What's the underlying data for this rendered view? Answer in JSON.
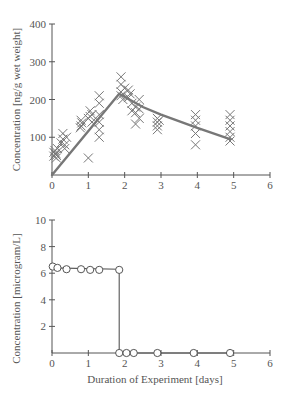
{
  "chart_data": [
    {
      "type": "scatter",
      "title": "",
      "xlabel": "",
      "ylabel": "Concentration [ng/g wet weight]",
      "xlim": [
        0,
        6
      ],
      "ylim": [
        0,
        400
      ],
      "xticks": [
        "0",
        "1",
        "2",
        "3",
        "4",
        "5",
        "6"
      ],
      "yticks": [
        "100",
        "200",
        "300",
        "400"
      ],
      "grid": false,
      "legend": null,
      "series": [
        {
          "name": "Observed tissue concentration",
          "marker": "x",
          "points": [
            [
              0.05,
              60
            ],
            [
              0.05,
              50
            ],
            [
              0.08,
              65
            ],
            [
              0.1,
              55
            ],
            [
              0.12,
              45
            ],
            [
              0.15,
              70
            ],
            [
              0.1,
              58
            ],
            [
              0.12,
              52
            ],
            [
              0.3,
              110
            ],
            [
              0.3,
              95
            ],
            [
              0.35,
              80
            ],
            [
              0.35,
              70
            ],
            [
              0.4,
              100
            ],
            [
              0.25,
              85
            ],
            [
              0.8,
              145
            ],
            [
              0.8,
              130
            ],
            [
              0.82,
              138
            ],
            [
              0.78,
              125
            ],
            [
              1.05,
              170
            ],
            [
              1.05,
              155
            ],
            [
              1.0,
              150
            ],
            [
              1.1,
              140
            ],
            [
              1.0,
              45
            ],
            [
              1.1,
              160
            ],
            [
              1.3,
              210
            ],
            [
              1.3,
              190
            ],
            [
              1.3,
              160
            ],
            [
              1.3,
              140
            ],
            [
              1.3,
              120
            ],
            [
              1.3,
              100
            ],
            [
              1.9,
              260
            ],
            [
              1.9,
              240
            ],
            [
              1.9,
              220
            ],
            [
              1.9,
              210
            ],
            [
              1.95,
              200
            ],
            [
              2.0,
              230
            ],
            [
              2.1,
              225
            ],
            [
              2.1,
              205
            ],
            [
              2.15,
              215
            ],
            [
              2.2,
              190
            ],
            [
              2.2,
              170
            ],
            [
              2.3,
              165
            ],
            [
              2.3,
              180
            ],
            [
              2.4,
              200
            ],
            [
              2.4,
              175
            ],
            [
              2.4,
              150
            ],
            [
              2.3,
              135
            ],
            [
              2.9,
              150
            ],
            [
              2.9,
              140
            ],
            [
              2.9,
              130
            ],
            [
              2.9,
              120
            ],
            [
              2.95,
              145
            ],
            [
              3.95,
              160
            ],
            [
              3.95,
              145
            ],
            [
              3.95,
              130
            ],
            [
              3.95,
              110
            ],
            [
              3.95,
              80
            ],
            [
              4.9,
              160
            ],
            [
              4.9,
              145
            ],
            [
              4.9,
              130
            ],
            [
              4.9,
              115
            ],
            [
              4.9,
              100
            ],
            [
              4.9,
              90
            ]
          ]
        },
        {
          "name": "Model fit",
          "type": "line",
          "points": [
            [
              0,
              0
            ],
            [
              1.85,
              215
            ],
            [
              2.5,
              180
            ],
            [
              3,
              160
            ],
            [
              4,
              125
            ],
            [
              4.9,
              95
            ]
          ]
        }
      ]
    },
    {
      "type": "line",
      "title": "",
      "xlabel": "Duration of Experiment [days]",
      "ylabel": "Concentration [microgram/L]",
      "xlim": [
        0,
        6
      ],
      "ylim": [
        0,
        10
      ],
      "xticks": [
        "0",
        "1",
        "2",
        "3",
        "4",
        "5",
        "6"
      ],
      "yticks": [
        "2",
        "4",
        "6",
        "8",
        "10"
      ],
      "grid": false,
      "legend": null,
      "series": [
        {
          "name": "Water concentration",
          "marker": "o",
          "points": [
            [
              0.02,
              6.5
            ],
            [
              0.15,
              6.4
            ],
            [
              0.4,
              6.3
            ],
            [
              0.8,
              6.3
            ],
            [
              1.05,
              6.25
            ],
            [
              1.3,
              6.25
            ],
            [
              1.85,
              6.25
            ],
            [
              1.85,
              0
            ],
            [
              2.05,
              0
            ],
            [
              2.25,
              0
            ],
            [
              2.9,
              0
            ],
            [
              3.9,
              0
            ],
            [
              4.9,
              0
            ]
          ],
          "step_line": [
            [
              0,
              6.4
            ],
            [
              1.85,
              6.3
            ],
            [
              1.85,
              0
            ],
            [
              4.9,
              0
            ]
          ]
        }
      ]
    }
  ]
}
